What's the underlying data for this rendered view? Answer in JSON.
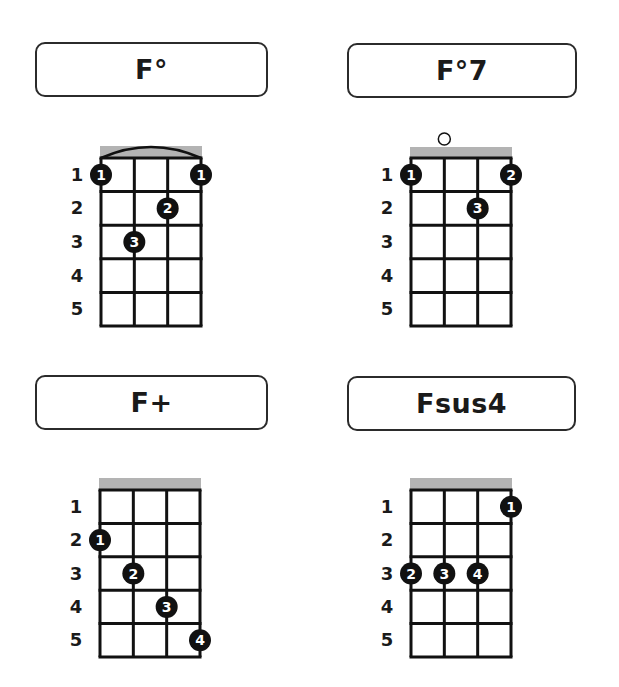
{
  "instrument": "ukulele",
  "colors": {
    "nut": "#b3b3b3",
    "grid": "#111111",
    "finger_dot": "#111111",
    "finger_text": "#ffffff",
    "title_border": "#2b2b2b"
  },
  "fret_labels": [
    "1",
    "2",
    "3",
    "4",
    "5"
  ],
  "chords": [
    {
      "name": "F°",
      "title_box": {
        "x": 35,
        "y": 42,
        "w": 233,
        "h": 55
      },
      "grid": {
        "x": 101,
        "y": 158,
        "w": 100,
        "h": 168
      },
      "nut": {
        "y": 146,
        "h": 12
      },
      "open_strings": [],
      "barre": {
        "from_string": 1,
        "to_string": 4
      },
      "fingers": [
        {
          "string": 1,
          "fret": 1,
          "finger": "1"
        },
        {
          "string": 4,
          "fret": 1,
          "finger": "1"
        },
        {
          "string": 3,
          "fret": 2,
          "finger": "2"
        },
        {
          "string": 2,
          "fret": 3,
          "finger": "3"
        }
      ]
    },
    {
      "name": "F°7",
      "title_box": {
        "x": 347,
        "y": 43,
        "w": 230,
        "h": 55
      },
      "grid": {
        "x": 411,
        "y": 158,
        "w": 100,
        "h": 168
      },
      "nut": {
        "y": 147,
        "h": 11
      },
      "open_strings": [
        2
      ],
      "barre": null,
      "fingers": [
        {
          "string": 1,
          "fret": 1,
          "finger": "1"
        },
        {
          "string": 4,
          "fret": 1,
          "finger": "2"
        },
        {
          "string": 3,
          "fret": 2,
          "finger": "3"
        }
      ]
    },
    {
      "name": "F+",
      "title_box": {
        "x": 35,
        "y": 375,
        "w": 233,
        "h": 55
      },
      "grid": {
        "x": 100,
        "y": 490,
        "w": 100,
        "h": 167
      },
      "nut": {
        "y": 478,
        "h": 12
      },
      "open_strings": [],
      "barre": null,
      "fingers": [
        {
          "string": 1,
          "fret": 2,
          "finger": "1"
        },
        {
          "string": 2,
          "fret": 3,
          "finger": "2"
        },
        {
          "string": 3,
          "fret": 4,
          "finger": "3"
        },
        {
          "string": 4,
          "fret": 5,
          "finger": "4"
        }
      ]
    },
    {
      "name": "Fsus4",
      "title_box": {
        "x": 347,
        "y": 376,
        "w": 229,
        "h": 55
      },
      "grid": {
        "x": 411,
        "y": 490,
        "w": 100,
        "h": 167
      },
      "nut": {
        "y": 478,
        "h": 12
      },
      "open_strings": [],
      "barre": null,
      "fingers": [
        {
          "string": 4,
          "fret": 1,
          "finger": "1"
        },
        {
          "string": 1,
          "fret": 3,
          "finger": "2"
        },
        {
          "string": 2,
          "fret": 3,
          "finger": "3"
        },
        {
          "string": 3,
          "fret": 3,
          "finger": "4"
        }
      ]
    }
  ]
}
